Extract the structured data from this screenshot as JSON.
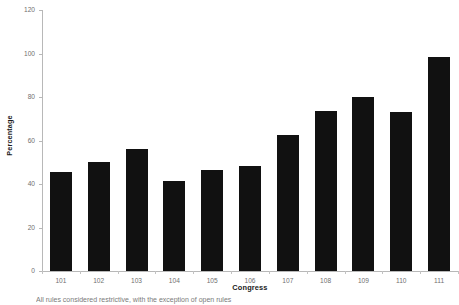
{
  "chart_data": {
    "type": "bar",
    "title": "",
    "xlabel": "Congress",
    "ylabel": "Percentage",
    "categories": [
      "101",
      "102",
      "103",
      "104",
      "105",
      "106",
      "107",
      "108",
      "109",
      "110",
      "111"
    ],
    "values": [
      45.5,
      50,
      56,
      41.5,
      46.5,
      48.5,
      62.5,
      73.5,
      80,
      73,
      98.5
    ],
    "ylim": [
      0,
      120
    ],
    "yticks": [
      0,
      20,
      40,
      60,
      80,
      100,
      120
    ],
    "ytick_labels": [
      "0",
      "20",
      "40",
      "60",
      "80",
      "100",
      "120"
    ],
    "grid": false,
    "legend": false,
    "bar_color": "#111111",
    "axis_color": "#b8b8b8",
    "tick_label_color": "#6f6f6f"
  },
  "caption": {
    "text": "All rules considered restrictive, with the exception of open rules"
  }
}
